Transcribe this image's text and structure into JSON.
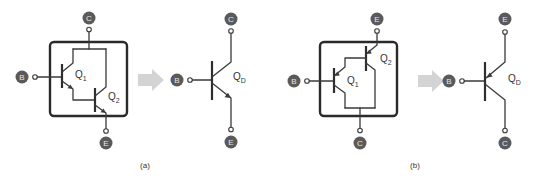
{
  "figure": {
    "panel_a": {
      "caption": "(a)",
      "composite": {
        "terminals": {
          "collector": "C",
          "base": "B",
          "emitter": "E"
        },
        "transistors": [
          {
            "name": "Q",
            "sub": "1"
          },
          {
            "name": "Q",
            "sub": "2"
          }
        ]
      },
      "equivalent": {
        "terminals": {
          "collector": "C",
          "base": "B",
          "emitter": "E"
        },
        "transistor": {
          "name": "Q",
          "sub": "D"
        }
      }
    },
    "panel_b": {
      "caption": "(b)",
      "composite": {
        "terminals": {
          "emitter": "E",
          "base": "B",
          "collector": "C"
        },
        "transistors": [
          {
            "name": "Q",
            "sub": "1"
          },
          {
            "name": "Q",
            "sub": "2"
          }
        ]
      },
      "equivalent": {
        "terminals": {
          "emitter": "E",
          "base": "B",
          "collector": "C"
        },
        "transistor": {
          "name": "Q",
          "sub": "D"
        }
      }
    }
  },
  "colors": {
    "line": "#3a3a3a",
    "node_fill": "#5a5a5a",
    "node_text": "#e6e6e6",
    "transform_arrow": "#d4d4d4"
  }
}
